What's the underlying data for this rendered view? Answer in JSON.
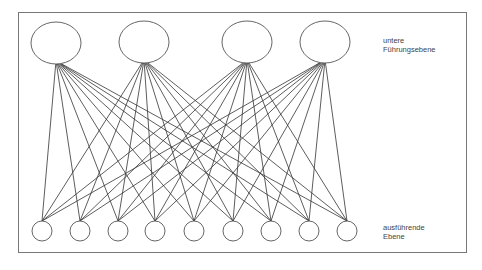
{
  "labels": {
    "top_line1": "untere",
    "top_line2": "Führungsebene",
    "bottom_line1": "ausführende",
    "bottom_line2": "Ebene"
  },
  "diagram": {
    "top_nodes": [
      {
        "cx": 56,
        "cy": 43
      },
      {
        "cx": 144,
        "cy": 42
      },
      {
        "cx": 247,
        "cy": 42
      },
      {
        "cx": 325,
        "cy": 42
      }
    ],
    "top_rx": 25,
    "top_ry": 21,
    "bottom_nodes": [
      {
        "cx": 42,
        "cy": 231
      },
      {
        "cx": 80,
        "cy": 231
      },
      {
        "cx": 118,
        "cy": 231
      },
      {
        "cx": 155,
        "cy": 231
      },
      {
        "cx": 194,
        "cy": 231
      },
      {
        "cx": 233,
        "cy": 231
      },
      {
        "cx": 271,
        "cy": 231
      },
      {
        "cx": 309,
        "cy": 231
      },
      {
        "cx": 347,
        "cy": 231
      }
    ],
    "bottom_r": 10,
    "edges": "all-to-all",
    "stroke": "#333333"
  }
}
